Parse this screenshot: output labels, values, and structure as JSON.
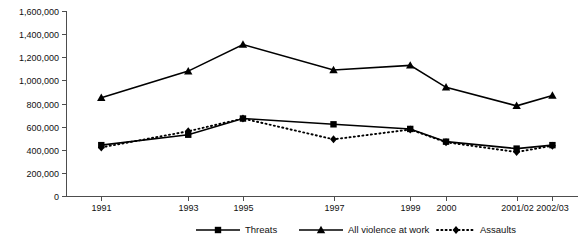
{
  "chart_data": {
    "type": "line",
    "title": "",
    "subtitle": "",
    "xlabel": "",
    "ylabel": "",
    "categories": [
      "1991",
      "1993",
      "1995",
      "1997",
      "1999",
      "2000",
      "2001/02",
      "2002/03"
    ],
    "ylim": [
      0,
      1600000
    ],
    "ytick_values": [
      0,
      200000,
      400000,
      600000,
      800000,
      1000000,
      1200000,
      1400000,
      1600000
    ],
    "ytick_labels": [
      "0",
      "200,000",
      "400,000",
      "600,000",
      "800,000",
      "1,000,000",
      "1,200,000",
      "1,400,000",
      "1,600,000"
    ],
    "grid": false,
    "legend_position": "bottom",
    "series": [
      {
        "name": "Threats",
        "marker": "square",
        "line_style": "solid",
        "color": "#000000",
        "values": [
          440000,
          530000,
          670000,
          620000,
          580000,
          470000,
          410000,
          440000
        ]
      },
      {
        "name": "All violence at work",
        "marker": "triangle",
        "line_style": "solid",
        "color": "#000000",
        "values": [
          850000,
          1080000,
          1310000,
          1090000,
          1130000,
          940000,
          780000,
          870000
        ]
      },
      {
        "name": "Assaults",
        "marker": "diamond",
        "line_style": "dotted",
        "color": "#000000",
        "values": [
          420000,
          560000,
          670000,
          490000,
          575000,
          465000,
          380000,
          435000
        ]
      }
    ]
  },
  "legend": {
    "items": [
      {
        "label": "Threats",
        "marker": "square-marker",
        "style": "solid"
      },
      {
        "label": "All violence at work",
        "marker": "triangle-marker",
        "style": "solid"
      },
      {
        "label": "Assaults",
        "marker": "diamond-marker",
        "style": "dotted"
      }
    ]
  }
}
